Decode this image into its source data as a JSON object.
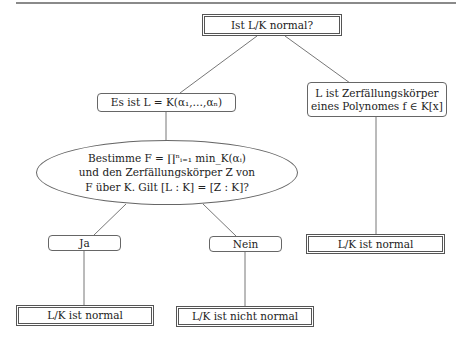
{
  "diagram": {
    "type": "decision-flowchart",
    "nodes": {
      "root": {
        "text": "Ist L/K normal?",
        "shape": "double-rect"
      },
      "adjoin": {
        "text": "Es ist L = K(α₁,…,αₙ)",
        "shape": "rounded-rect"
      },
      "splitting": {
        "lines": [
          "L ist Zerfällungskörper",
          "eines Polynomes  f ∈ K[x]"
        ],
        "shape": "rounded-rect"
      },
      "question": {
        "lines": [
          "Bestimme F = ∏ⁿᵢ₌₁ min_K(αᵢ)",
          "und den Zerfällungskörper  Z von",
          "F über K. Gilt [L : K] = [Z : K]?"
        ],
        "shape": "ellipse"
      },
      "yes": {
        "text": "Ja",
        "shape": "rounded-rect"
      },
      "no": {
        "text": "Nein",
        "shape": "rounded-rect"
      },
      "result_yes": {
        "text": "L/K ist normal",
        "shape": "double-rect"
      },
      "result_no": {
        "text": "L/K ist nicht normal",
        "shape": "double-rect"
      },
      "result_splitting": {
        "text": "L/K ist normal",
        "shape": "double-rect"
      }
    },
    "edges": [
      {
        "from": "root",
        "to": "adjoin"
      },
      {
        "from": "root",
        "to": "splitting"
      },
      {
        "from": "adjoin",
        "to": "question"
      },
      {
        "from": "question",
        "to": "yes"
      },
      {
        "from": "question",
        "to": "no"
      },
      {
        "from": "yes",
        "to": "result_yes"
      },
      {
        "from": "no",
        "to": "result_no"
      },
      {
        "from": "splitting",
        "to": "result_splitting"
      }
    ],
    "colors": {
      "line": "#777777",
      "border": "#555555",
      "background": "#ffffff"
    }
  }
}
